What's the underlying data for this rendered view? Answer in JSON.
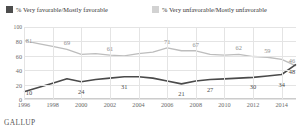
{
  "legend": {
    "favorable": {
      "label": "% Very favorable/Mostly favorable",
      "color": "#4d4d4d",
      "swatch": "dark-square-icon"
    },
    "unfavorable": {
      "label": "% Very unfavorable/Mostly unfavorable",
      "color": "#d2d2d2",
      "swatch": "light-square-icon"
    }
  },
  "source": "GALLUP",
  "chart_data": {
    "type": "line",
    "title": "",
    "xlabel": "",
    "ylabel": "",
    "ylim": [
      0,
      100
    ],
    "yticks": [
      0,
      20,
      40,
      60,
      80,
      100
    ],
    "grid": true,
    "legend_position": "top",
    "x": [
      1996,
      1997,
      1998,
      1999,
      2000,
      2001,
      2002,
      2003,
      2004,
      2005,
      2006,
      2007,
      2008,
      2009,
      2010,
      2011,
      2012,
      2013,
      2014,
      2015
    ],
    "xticks": [
      1996,
      1998,
      2000,
      2002,
      2004,
      2006,
      2008,
      2010,
      2012,
      2014
    ],
    "series": [
      {
        "name": "% Very favorable/Mostly favorable",
        "color": "#bdbdbd",
        "values": [
          81,
          77,
          73,
          69,
          62,
          63,
          61,
          60,
          63,
          65,
          71,
          67,
          67,
          62,
          61,
          62,
          59,
          58,
          55,
          46
        ],
        "labels": [
          {
            "x": 1996,
            "value": 81
          },
          {
            "x": 1999,
            "value": 69
          },
          {
            "x": 2002,
            "value": 61
          },
          {
            "x": 2006,
            "value": 71
          },
          {
            "x": 2008,
            "value": 67
          },
          {
            "x": 2011,
            "value": 62
          },
          {
            "x": 2013,
            "value": 59
          },
          {
            "x": 2015,
            "value": 46
          }
        ]
      },
      {
        "name": "% Very unfavorable/Mostly unfavorable",
        "color": "#4a4a4a",
        "values": [
          10,
          16,
          22,
          28,
          24,
          27,
          29,
          31,
          31,
          29,
          25,
          21,
          25,
          27,
          28,
          29,
          30,
          32,
          34,
          48
        ],
        "labels": [
          {
            "x": 1996,
            "value": 10
          },
          {
            "x": 2000,
            "value": 24
          },
          {
            "x": 2003,
            "value": 31
          },
          {
            "x": 2007,
            "value": 21
          },
          {
            "x": 2009,
            "value": 27
          },
          {
            "x": 2012,
            "value": 30
          },
          {
            "x": 2014,
            "value": 34
          },
          {
            "x": 2015,
            "value": 48
          }
        ]
      }
    ]
  }
}
